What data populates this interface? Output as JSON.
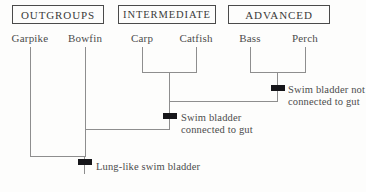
{
  "figure": {
    "type": "cladogram",
    "title": ""
  },
  "categories": [
    {
      "id": "outgroups",
      "label": "OUTGROUPS"
    },
    {
      "id": "intermediate",
      "label": "INTERMEDIATE"
    },
    {
      "id": "advanced",
      "label": "ADVANCED"
    }
  ],
  "taxa": [
    {
      "id": "garpike",
      "label": "Garpike",
      "group": "outgroups"
    },
    {
      "id": "bowfin",
      "label": "Bowfin",
      "group": "outgroups"
    },
    {
      "id": "carp",
      "label": "Carp",
      "group": "intermediate"
    },
    {
      "id": "catfish",
      "label": "Catfish",
      "group": "intermediate"
    },
    {
      "id": "bass",
      "label": "Bass",
      "group": "advanced"
    },
    {
      "id": "perch",
      "label": "Perch",
      "group": "advanced"
    }
  ],
  "traits": [
    {
      "id": "swim-bladder-not-connected",
      "line1": "Swim bladder not",
      "line2": "connected to gut"
    },
    {
      "id": "swim-bladder-connected",
      "line1": "Swim bladder",
      "line2": "connected to gut"
    },
    {
      "id": "lung-like-swim-bladder",
      "line1": "Lung-like swim bladder",
      "line2": ""
    }
  ],
  "colors": {
    "background": "#fdfdfc",
    "line": "#8e8e8e",
    "box_border": "#4a4a4a",
    "text": "#4c4c4c",
    "tick": "#16161a"
  }
}
